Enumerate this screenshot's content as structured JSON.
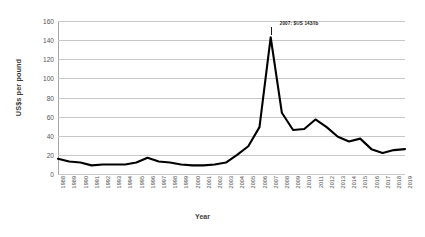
{
  "chart_data": {
    "type": "line",
    "title": "",
    "xlabel": "Year",
    "ylabel": "US$s per pound",
    "ylim": [
      0,
      160
    ],
    "yticks": [
      0,
      20,
      40,
      60,
      80,
      100,
      120,
      140,
      160
    ],
    "grid": true,
    "legend": false,
    "line_color": "#000000",
    "categories": [
      "1988",
      "1989",
      "1990",
      "1991",
      "1992",
      "1993",
      "1994",
      "1995",
      "1996",
      "1997",
      "1998",
      "1999",
      "2000",
      "2001",
      "2002",
      "2003",
      "2004",
      "2005",
      "2006",
      "2007",
      "2008",
      "2009",
      "2010",
      "2011",
      "2012",
      "2013",
      "2014",
      "2015",
      "2016",
      "2017",
      "2018",
      "2019"
    ],
    "values": [
      16,
      13,
      12,
      9,
      10,
      10,
      10,
      12,
      17,
      13,
      12,
      10,
      9,
      9,
      10,
      12,
      20,
      29,
      49,
      143,
      64,
      46,
      47,
      57,
      49,
      39,
      34,
      37,
      26,
      22,
      25,
      26
    ],
    "annotations": [
      {
        "text": "2007: $US 143/lb",
        "x_category": "2007",
        "y_value": 143
      }
    ]
  }
}
